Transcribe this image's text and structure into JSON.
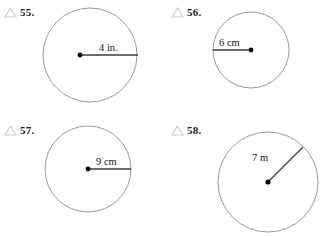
{
  "page": {
    "width": 334,
    "height": 236,
    "background": "#ffffff",
    "stroke_color": "#8f8f8f",
    "radius_line_color": "#3a3a3a",
    "text_color": "#151515",
    "triangle_icon_color": "#c9c9c9"
  },
  "problems": [
    {
      "number": "55.",
      "icon": "triangle-outline-icon",
      "measure_label": "4 in.",
      "unit": "in.",
      "value": 4,
      "shape": "circle",
      "radius_direction": "right",
      "circle": {
        "cx": 90,
        "cy": 55,
        "r": 47
      },
      "center_dot": {
        "x": 80,
        "y": 55
      },
      "radius_line": {
        "x1": 80,
        "y1": 55,
        "x2": 138,
        "y2": 55
      },
      "label_pos": {
        "x": 99,
        "y": 42
      }
    },
    {
      "number": "56.",
      "icon": "triangle-outline-icon",
      "measure_label": "6 cm",
      "unit": "cm",
      "value": 6,
      "shape": "circle",
      "radius_direction": "left",
      "circle": {
        "cx": 251,
        "cy": 50,
        "r": 38
      },
      "center_dot": {
        "x": 251,
        "y": 50
      },
      "radius_line": {
        "x1": 213,
        "y1": 50,
        "x2": 251,
        "y2": 50
      },
      "label_pos": {
        "x": 219,
        "y": 37
      }
    },
    {
      "number": "57.",
      "icon": "triangle-outline-icon",
      "measure_label": "9 cm",
      "unit": "cm",
      "value": 9,
      "shape": "circle",
      "radius_direction": "right",
      "circle": {
        "cx": 88,
        "cy": 169,
        "r": 43
      },
      "center_dot": {
        "x": 88,
        "y": 169
      },
      "radius_line": {
        "x1": 88,
        "y1": 169,
        "x2": 131,
        "y2": 169
      },
      "label_pos": {
        "x": 96,
        "y": 156
      }
    },
    {
      "number": "58.",
      "icon": "triangle-outline-icon",
      "measure_label": "7 m",
      "unit": "m",
      "value": 7,
      "shape": "circle",
      "radius_direction": "upper-right",
      "circle": {
        "cx": 268,
        "cy": 182,
        "r": 50
      },
      "center_dot": {
        "x": 268,
        "y": 182
      },
      "radius_line": {
        "x1": 268,
        "y1": 182,
        "x2": 303,
        "y2": 147
      },
      "label_pos": {
        "x": 252,
        "y": 152
      }
    }
  ]
}
